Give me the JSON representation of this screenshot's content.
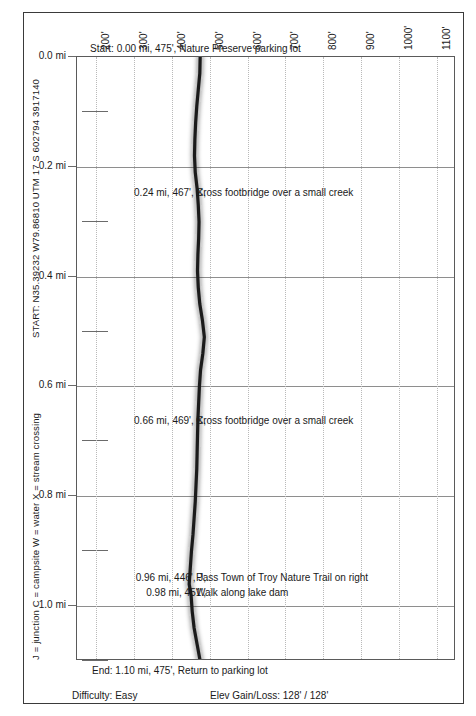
{
  "chart_data": {
    "type": "line",
    "title": "",
    "orientation": "vertical-profile",
    "xlabel": "Elevation (feet)",
    "ylabel": "Distance (miles)",
    "xlim": [
      150,
      1150
    ],
    "ylim": [
      0.0,
      1.1
    ],
    "grid": true,
    "elevation_ticks": [
      "200'",
      "300'",
      "400'",
      "500'",
      "600'",
      "700'",
      "800'",
      "900'",
      "1000'",
      "1100'"
    ],
    "elevation_tick_values": [
      200,
      300,
      400,
      500,
      600,
      700,
      800,
      900,
      1000,
      1100
    ],
    "mile_ticks": [
      "0.0 mi",
      "0.2 mi",
      "0.4 mi",
      "0.6 mi",
      "0.8 mi",
      "1.0 mi"
    ],
    "mile_tick_values": [
      0.0,
      0.2,
      0.4,
      0.6,
      0.8,
      1.0
    ],
    "mile_minor_ticks": [
      0.1,
      0.3,
      0.5,
      0.7,
      0.9,
      1.1
    ],
    "series": [
      {
        "name": "Trail elevation profile",
        "x_miles": [
          0.0,
          0.03,
          0.06,
          0.09,
          0.12,
          0.15,
          0.18,
          0.21,
          0.24,
          0.27,
          0.3,
          0.33,
          0.36,
          0.39,
          0.42,
          0.45,
          0.48,
          0.51,
          0.54,
          0.57,
          0.6,
          0.63,
          0.66,
          0.69,
          0.72,
          0.75,
          0.78,
          0.81,
          0.84,
          0.87,
          0.9,
          0.93,
          0.96,
          0.98,
          1.01,
          1.04,
          1.07,
          1.1
        ],
        "y_elev_ft": [
          475,
          474,
          470,
          466,
          463,
          461,
          460,
          462,
          467,
          470,
          472,
          471,
          469,
          468,
          470,
          474,
          481,
          486,
          482,
          476,
          473,
          471,
          469,
          468,
          467,
          466,
          464,
          462,
          459,
          456,
          452,
          449,
          446,
          451,
          454,
          459,
          467,
          475
        ]
      }
    ]
  },
  "top_note": "Start: 0.00 mi, 475', Nature Preserve parking lot",
  "bottom_note": "End: 1.10 mi, 475', Return to parking lot",
  "side": {
    "start_coords": "START: N35.39232 W79.86810   UTM 17 S 602794 3917140",
    "legend_key": "J = junction  C = campsite  W = water  X = stream crossing"
  },
  "waypoints": [
    {
      "id": "wp-024",
      "left": "0.24 mi, 467', X,",
      "right": "Cross footbridge over a small creek"
    },
    {
      "id": "wp-066",
      "left": "0.66 mi, 469', X,",
      "right": "Cross footbridge over a small creek"
    },
    {
      "id": "wp-096",
      "left": "0.96 mi, 446', J,",
      "right": "Pass Town of Troy Nature Trail on right"
    },
    {
      "id": "wp-098",
      "left": "0.98 mi, 451',",
      "right": "Walk along lake dam"
    }
  ],
  "footer": {
    "difficulty": "Difficulty: Easy",
    "elev_gain_loss": "Elev Gain/Loss: 128' / 128'"
  },
  "colors": {
    "trace": "#1b1b1b",
    "frame": "#3a3a3a",
    "plot_border": "#5a5a5a",
    "grid_major": "#8e8e8e",
    "grid_minor": "#b9b9b9",
    "text": "#1a1a1a"
  }
}
